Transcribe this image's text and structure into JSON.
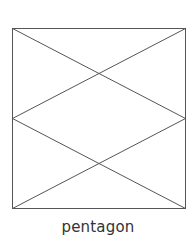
{
  "diagram": {
    "label": "pentagon",
    "stroke_color": "#555555",
    "box": {
      "x1": 12.5,
      "y1": 28.5,
      "x2": 185.5,
      "y2": 208.5
    },
    "lines": [
      {
        "from": "top-left",
        "to": "right-middle"
      },
      {
        "from": "top-right",
        "to": "left-middle"
      },
      {
        "from": "left-middle",
        "to": "bottom-right"
      },
      {
        "from": "right-middle",
        "to": "bottom-left"
      }
    ]
  }
}
